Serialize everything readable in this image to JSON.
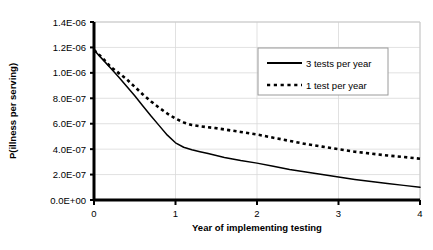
{
  "chart_data": {
    "type": "line",
    "title": "",
    "xlabel": "Year of implementing testing",
    "ylabel": "P(illness per serving)",
    "xlim": [
      0,
      4
    ],
    "ylim": [
      0,
      1.4e-06
    ],
    "xticks": [
      0,
      1,
      2,
      3,
      4
    ],
    "xtick_labels": [
      "0",
      "1",
      "2",
      "3",
      "4"
    ],
    "yticks": [
      0,
      2e-07,
      4e-07,
      6e-07,
      8e-07,
      1e-06,
      1.2e-06,
      1.4e-06
    ],
    "ytick_labels": [
      "0.0E+00",
      "2.0E-07",
      "4.0E-07",
      "6.0E-07",
      "8.0E-07",
      "1.0E-06",
      "1.2E-06",
      "1.4E-06"
    ],
    "grid": true,
    "grid_axis": "both",
    "legend_position": "upper right",
    "series": [
      {
        "name": "3 tests per year",
        "style": "solid",
        "color": "#000000",
        "x": [
          0,
          0.1,
          0.2,
          0.3,
          0.4,
          0.5,
          0.6,
          0.7,
          0.8,
          0.9,
          1.0,
          1.1,
          1.2,
          1.3,
          1.4,
          1.5,
          1.6,
          1.8,
          2.0,
          2.2,
          2.4,
          2.6,
          2.8,
          3.0,
          3.2,
          3.4,
          3.6,
          3.8,
          4.0
        ],
        "y": [
          1.18e-06,
          1.11e-06,
          1.04e-06,
          9.7e-07,
          8.95e-07,
          8.2e-07,
          7.4e-07,
          6.6e-07,
          5.85e-07,
          5.1e-07,
          4.5e-07,
          4.15e-07,
          3.95e-07,
          3.8e-07,
          3.65e-07,
          3.5e-07,
          3.35e-07,
          3.1e-07,
          2.9e-07,
          2.65e-07,
          2.4e-07,
          2.2e-07,
          2e-07,
          1.8e-07,
          1.62e-07,
          1.45e-07,
          1.3e-07,
          1.15e-07,
          1e-07
        ]
      },
      {
        "name": "1 test per year",
        "style": "dashed",
        "color": "#000000",
        "x": [
          0,
          0.1,
          0.2,
          0.3,
          0.4,
          0.5,
          0.6,
          0.7,
          0.8,
          0.9,
          1.0,
          1.1,
          1.2,
          1.3,
          1.4,
          1.5,
          1.6,
          1.8,
          2.0,
          2.2,
          2.4,
          2.6,
          2.8,
          3.0,
          3.2,
          3.4,
          3.6,
          3.8,
          4.0
        ],
        "y": [
          1.18e-06,
          1.12e-06,
          1.05e-06,
          1e-06,
          9.5e-07,
          8.9e-07,
          8.3e-07,
          7.75e-07,
          7.25e-07,
          6.8e-07,
          6.4e-07,
          6.1e-07,
          5.9e-07,
          5.8e-07,
          5.72e-07,
          5.65e-07,
          5.55e-07,
          5.35e-07,
          5.15e-07,
          4.9e-07,
          4.65e-07,
          4.4e-07,
          4.2e-07,
          4e-07,
          3.8e-07,
          3.65e-07,
          3.5e-07,
          3.38e-07,
          3.25e-07
        ]
      }
    ]
  },
  "legend": {
    "entries": [
      {
        "label": "3 tests per year",
        "style": "solid"
      },
      {
        "label": "1 test per year",
        "style": "dashed"
      }
    ]
  }
}
